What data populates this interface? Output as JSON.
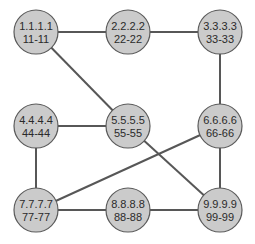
{
  "diagram": {
    "type": "network-graph",
    "colors": {
      "node_fill": "#cbcbcb",
      "node_stroke": "#5a5a5a",
      "edge": "#575757",
      "text": "#2a2a2a",
      "background": "#ffffff"
    },
    "node_radius": 22,
    "nodes": [
      {
        "id": "n1",
        "line1": "1.1.1.1",
        "line2": "11-11",
        "x": 36,
        "y": 32
      },
      {
        "id": "n2",
        "line1": "2.2.2.2",
        "line2": "22-22",
        "x": 128,
        "y": 32
      },
      {
        "id": "n3",
        "line1": "3.3.3.3",
        "line2": "33-33",
        "x": 220,
        "y": 32
      },
      {
        "id": "n4",
        "line1": "4.4.4.4",
        "line2": "44-44",
        "x": 36,
        "y": 126
      },
      {
        "id": "n5",
        "line1": "5.5.5.5",
        "line2": "55-55",
        "x": 128,
        "y": 126
      },
      {
        "id": "n6",
        "line1": "6.6.6.6",
        "line2": "66-66",
        "x": 220,
        "y": 126
      },
      {
        "id": "n7",
        "line1": "7.7.7.7",
        "line2": "77-77",
        "x": 36,
        "y": 210
      },
      {
        "id": "n8",
        "line1": "8.8.8.8",
        "line2": "88-88",
        "x": 128,
        "y": 210
      },
      {
        "id": "n9",
        "line1": "9.9.9.9",
        "line2": "99-99",
        "x": 220,
        "y": 210
      }
    ],
    "edges": [
      {
        "from": "n1",
        "to": "n2"
      },
      {
        "from": "n2",
        "to": "n3"
      },
      {
        "from": "n1",
        "to": "n5"
      },
      {
        "from": "n3",
        "to": "n6"
      },
      {
        "from": "n4",
        "to": "n5"
      },
      {
        "from": "n4",
        "to": "n7"
      },
      {
        "from": "n6",
        "to": "n7"
      },
      {
        "from": "n5",
        "to": "n9"
      },
      {
        "from": "n6",
        "to": "n9"
      },
      {
        "from": "n7",
        "to": "n8"
      },
      {
        "from": "n8",
        "to": "n9"
      }
    ]
  }
}
